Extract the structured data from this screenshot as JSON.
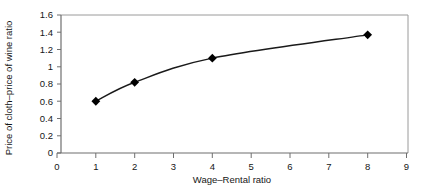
{
  "chart_data": {
    "type": "line",
    "title": "",
    "xlabel": "Wage–Rental ratio",
    "ylabel": "Price of cloth–price of wine ratio",
    "x": [
      1,
      2,
      4,
      8
    ],
    "values": [
      0.6,
      0.82,
      1.1,
      1.37
    ],
    "series": [
      {
        "name": "Price of cloth–price of wine ratio",
        "x": [
          1,
          2,
          4,
          8
        ],
        "values": [
          0.6,
          0.82,
          1.1,
          1.37
        ]
      }
    ],
    "xlim": [
      0,
      9
    ],
    "ylim": [
      0,
      1.6
    ],
    "xticks": [
      "0",
      "1",
      "2",
      "3",
      "4",
      "5",
      "6",
      "7",
      "8",
      "9"
    ],
    "yticks": [
      "0",
      "0.2",
      "0.4",
      "0.6",
      "0.8",
      "1",
      "1.2",
      "1.4",
      "1.6"
    ],
    "xtick_values": [
      0,
      1,
      2,
      3,
      4,
      5,
      6,
      7,
      8,
      9
    ],
    "ytick_values": [
      0,
      0.2,
      0.4,
      0.6,
      0.8,
      1,
      1.2,
      1.4,
      1.6
    ],
    "grid": false,
    "legend": null,
    "legend_position": "none",
    "marker": "filled-diamond",
    "marker_color": "#000000",
    "line_color": "#1a1a1a",
    "frame_color": "#8a8a8a",
    "background_color": "#ffffff"
  }
}
